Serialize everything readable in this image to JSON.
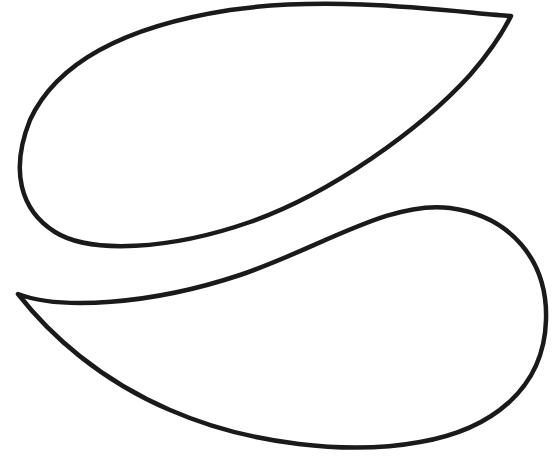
{
  "image": {
    "width": 552,
    "height": 462,
    "background": "#ffffff",
    "description": "Line drawing of two teardrop / paisley outline shapes"
  },
  "shapes": [
    {
      "name": "upper-teardrop",
      "stroke": "#1a1a1a",
      "stroke_width": 4.5,
      "path": "M511 16 C 470 14, 340 -6, 230 10 C 140 24, 60 55, 30 120 C 10 170, 20 210, 55 232 C 90 254, 170 250, 250 222 C 330 194, 420 130, 470 75 C 490 52, 503 32, 511 16 Z"
    },
    {
      "name": "lower-teardrop",
      "stroke": "#1a1a1a",
      "stroke_width": 4.5,
      "path": "M18 294 C 60 310, 150 305, 240 275 C 320 248, 390 200, 450 208 C 510 216, 548 260, 546 320 C 544 390, 490 430, 420 442 C 350 455, 250 445, 170 410 C 100 380, 50 335, 18 294 Z"
    }
  ]
}
